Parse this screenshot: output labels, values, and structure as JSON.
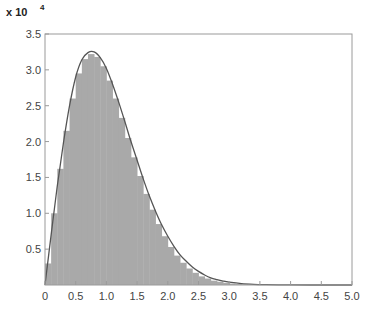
{
  "chart_data": {
    "type": "bar",
    "title": "",
    "xlabel": "",
    "ylabel": "",
    "y_multiplier_label": "x 10",
    "y_multiplier_exponent": "4",
    "xlim": [
      0,
      5.0
    ],
    "ylim": [
      0,
      3.5
    ],
    "x_ticks": [
      "0",
      "0.5",
      "1.0",
      "1.5",
      "2.0",
      "2.5",
      "3.0",
      "3.5",
      "4.0",
      "4.5",
      "5.0"
    ],
    "y_ticks": [
      "0.5",
      "1.0",
      "1.5",
      "2.0",
      "2.5",
      "3.0",
      "3.5"
    ],
    "grid": false,
    "legend": null,
    "series": [
      {
        "name": "histogram",
        "kind": "bar",
        "color": "#a9a9a9",
        "bin_width": 0.1,
        "x": [
          0.05,
          0.15,
          0.25,
          0.35,
          0.45,
          0.55,
          0.65,
          0.75,
          0.85,
          0.95,
          1.05,
          1.15,
          1.25,
          1.35,
          1.45,
          1.55,
          1.65,
          1.75,
          1.85,
          1.95,
          2.05,
          2.15,
          2.25,
          2.35,
          2.45,
          2.55,
          2.65,
          2.75,
          2.85,
          2.95,
          3.05,
          3.15,
          3.25,
          3.35,
          3.45
        ],
        "values": [
          0.3,
          1.0,
          1.62,
          2.15,
          2.6,
          2.95,
          3.15,
          3.22,
          3.18,
          3.05,
          2.85,
          2.6,
          2.33,
          2.05,
          1.78,
          1.52,
          1.27,
          1.05,
          0.85,
          0.68,
          0.53,
          0.41,
          0.31,
          0.23,
          0.17,
          0.12,
          0.09,
          0.06,
          0.045,
          0.03,
          0.02,
          0.013,
          0.008,
          0.005,
          0.003
        ]
      },
      {
        "name": "fitted-pdf",
        "kind": "line",
        "color": "#555555",
        "x": [
          0,
          0.1,
          0.2,
          0.3,
          0.4,
          0.5,
          0.6,
          0.7,
          0.8,
          0.9,
          1.0,
          1.1,
          1.2,
          1.3,
          1.4,
          1.5,
          1.6,
          1.7,
          1.8,
          1.9,
          2.0,
          2.1,
          2.2,
          2.3,
          2.4,
          2.5,
          2.6,
          2.7,
          2.8,
          2.9,
          3.0,
          3.2,
          3.4,
          3.6,
          3.8,
          4.0,
          4.5,
          5.0
        ],
        "values": [
          0,
          0.7,
          1.38,
          1.98,
          2.5,
          2.9,
          3.14,
          3.24,
          3.25,
          3.17,
          3.02,
          2.8,
          2.55,
          2.28,
          2.0,
          1.74,
          1.48,
          1.24,
          1.03,
          0.84,
          0.68,
          0.54,
          0.42,
          0.33,
          0.25,
          0.19,
          0.14,
          0.1,
          0.075,
          0.055,
          0.04,
          0.02,
          0.01,
          0.005,
          0.002,
          0.001,
          0,
          0
        ]
      }
    ]
  }
}
